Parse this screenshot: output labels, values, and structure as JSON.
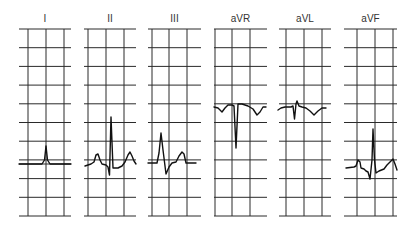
{
  "diagram": {
    "type": "ecg-limb-leads",
    "grid": {
      "rows_y": [
        29,
        47.7,
        66.4,
        85.1,
        103.8,
        122.5,
        141.2,
        159.9,
        178.6,
        197.3,
        216
      ],
      "line_color": "#2a2a2a",
      "trace_color": "#111111"
    },
    "leads": [
      {
        "label": "I",
        "x0": 19,
        "x1": 71,
        "verticals": [
          28,
          46,
          64
        ],
        "extra_lines_y": [
          164
        ],
        "trace": "19,164 42,164 44.5,160 46,146 47.5,160 50,164 71,164"
      },
      {
        "label": "II",
        "x0": 84,
        "x1": 136,
        "verticals": [
          88,
          106,
          124
        ],
        "extra_lines_y": [],
        "trace": "85,166 91,164 94,162 96,155 98,154 100,160 102,164 106,165 108,167 109.5,175 111,117 113,168 118,168 122,166 125,162 128,155 130,152 132,156 134,161 136,164"
      },
      {
        "label": "III",
        "x0": 148,
        "x1": 201,
        "verticals": [
          152,
          169,
          187
        ],
        "extra_lines_y": [],
        "trace": "148,163 157,163 159,153 161,133 163,150 166,174 169,167 172,163 176,162 179,156 182,152 184,154 186,163 196,163"
      },
      {
        "label": "aVR",
        "x0": 214,
        "x1": 267,
        "verticals": [
          215,
          232,
          250
        ],
        "extra_lines_y": [],
        "trace": "214,107 218,108 222,112 225,108 228,105 232,105 234,106 236,148 238,104 242,104 248,106 253,109 257,115 260,112 263,107 266,107"
      },
      {
        "label": "aVL",
        "x0": 279,
        "x1": 331,
        "verticals": [
          286,
          304,
          322
        ],
        "extra_lines_y": [],
        "trace": "278,110 281,108 285,107 291,107 293,106 294.5,119 296,104 297,101 299,106 302,107 306,108 310,111 314,115 318,111 322,108 326,108"
      },
      {
        "label": "aVF",
        "x0": 344,
        "x1": 397,
        "verticals": [
          357,
          375,
          393
        ],
        "extra_lines_y": [],
        "trace": "346,168 354,167 356,166 358,160 360,162 361,168 364,169 366,171 368,172 370,179 372,160 373,129 374.5,160 376,173 379,171 384,169 387,165 390,162 393,159 395,164 397,170"
      }
    ]
  }
}
